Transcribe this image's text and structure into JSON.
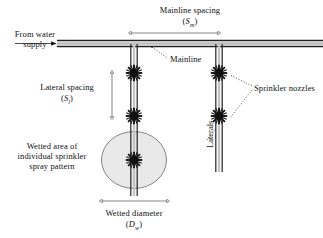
{
  "figure": {
    "type": "irrigation-system-layout-diagram",
    "background_color": "#ffffff",
    "ink_color": "#111111",
    "wetted_area_fill": "#e8e8e8"
  },
  "labels": {
    "mainline_spacing": {
      "line1": "Mainline spacing",
      "symbol_open": "(",
      "symbol_base": "S",
      "symbol_sub": "m",
      "symbol_close": ")"
    },
    "from_water_supply": {
      "line1": "From water",
      "line2": "supply"
    },
    "mainline": "Mainline",
    "lateral_spacing": {
      "line1": "Lateral spacing",
      "symbol_open": "(",
      "symbol_base": "S",
      "symbol_sub": "l",
      "symbol_close": ")"
    },
    "laterals": "Laterals",
    "sprinkler_nozzles": "Sprinkler nozzles",
    "wetted_area": {
      "line1": "Wetted area of",
      "line2": "individual sprinkler",
      "line3": "spray pattern"
    },
    "wetted_diameter": {
      "line1": "Wetted diameter",
      "symbol_open": "(",
      "symbol_base": "D",
      "symbol_sub": "w",
      "symbol_close": ")"
    }
  },
  "geometry": {
    "mainline_y_top": 40,
    "mainline_y_bottom": 46,
    "mainline_x_start": 57,
    "mainline_x_end": 323,
    "lateral_left_x": 134,
    "lateral_right_x": 219,
    "sprinkler_positions": [
      {
        "x": 134,
        "y": 73
      },
      {
        "x": 134,
        "y": 116
      },
      {
        "x": 134,
        "y": 160
      },
      {
        "x": 219,
        "y": 73
      },
      {
        "x": 219,
        "y": 116
      }
    ],
    "wetted_circle": {
      "cx": 134,
      "cy": 160,
      "rx": 32,
      "ry": 28
    },
    "dim_mainline_spacing": {
      "x1": 131,
      "x2": 216,
      "y": 33
    },
    "dim_lateral_spacing": {
      "x": 112,
      "y1": 72,
      "y2": 118
    },
    "dim_wetted_diameter": {
      "x1": 102,
      "x2": 166,
      "y": 201
    }
  }
}
